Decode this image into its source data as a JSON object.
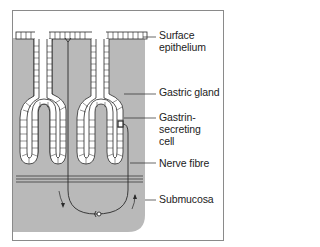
{
  "figure": {
    "type": "anatomical-diagram",
    "labels": [
      {
        "id": "surface-epithelium",
        "line1": "Surface",
        "line2": "epithelium"
      },
      {
        "id": "gastric-gland",
        "line1": "Gastric gland"
      },
      {
        "id": "gastrin-secreting-cell",
        "line1": "Gastrin-",
        "line2": "secreting",
        "line3": "cell"
      },
      {
        "id": "nerve-fibre",
        "line1": "Nerve fibre"
      },
      {
        "id": "submucosa",
        "line1": "Submucosa"
      }
    ],
    "colors": {
      "tissue": "#b9b9b9",
      "epithelium_fill": "#ffffff",
      "line": "#2a2a2a",
      "frame": "#8a8a8a"
    }
  }
}
